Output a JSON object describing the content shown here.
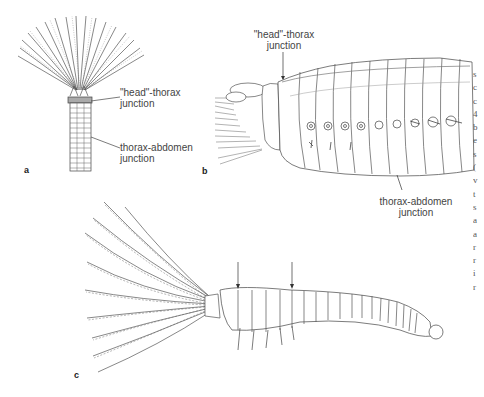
{
  "figure": {
    "panels": [
      {
        "id": "a",
        "letter": "a",
        "labels": [
          {
            "line1": "\"head\"-thorax",
            "line2": "junction"
          },
          {
            "line1": "thorax-abdomen",
            "line2": "junction"
          }
        ]
      },
      {
        "id": "b",
        "letter": "b",
        "labels": [
          {
            "line1": "\"head\"-thorax",
            "line2": "junction"
          },
          {
            "line1": "thorax-abdomen",
            "line2": "junction"
          }
        ]
      },
      {
        "id": "c",
        "letter": "c",
        "labels": []
      }
    ],
    "right_edge_text_fragments": [
      "s",
      "c",
      "c",
      "4",
      "b",
      "e",
      "s",
      "(",
      "v",
      "t",
      "s",
      "a",
      "a",
      "r",
      "r",
      "i",
      "r"
    ],
    "colors": {
      "ink": "#333333",
      "light_ink": "#888888",
      "background": "#ffffff"
    }
  }
}
